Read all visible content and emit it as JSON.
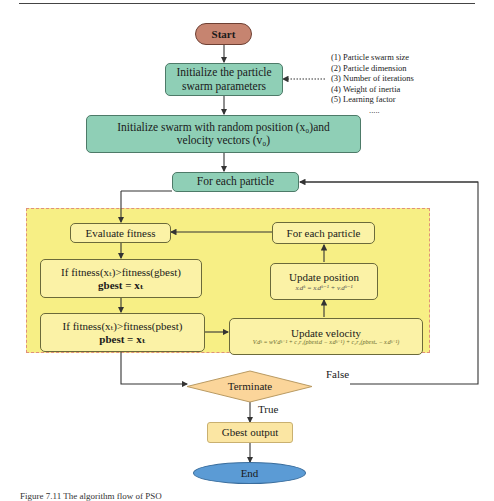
{
  "diagram": {
    "type": "flowchart",
    "nodes": {
      "start": "Start",
      "init_params_line1": "Initialize the particle",
      "init_params_line2": "swarm parameters",
      "init_swarm_line1": "Initialize swarm with random position (x₀)and",
      "init_swarm_line2": "velocity vectors (v₀)",
      "for_each_outer": "For each particle",
      "evaluate_fitness": "Evaluate fitness",
      "gbest_cond": "If fitness(xₜ)>fitness(gbest)",
      "gbest_assign": "gbest = xₜ",
      "pbest_cond": "If fitness(xₜ)>fitness(pbest)",
      "pbest_assign": "pbest = xₜ",
      "for_each_inner": "For each particle",
      "update_position": "Update position",
      "update_position_formula": "xᵢdᵏ = xᵢdᵏ⁻¹ + vᵢdᵏ⁻¹",
      "update_velocity": "Update velocity",
      "update_velocity_formula": "Vᵢdᵏ = wVᵢdᵏ⁻¹ + c₁r₁(pbestᵢd − xᵢdᵏ⁻¹) + c₂r₂(pbestₐ − xᵢdᵏ⁻¹)",
      "terminate": "Terminate",
      "gbest_output": "Gbest output",
      "end": "End"
    },
    "edge_labels": {
      "false": "False",
      "true": "True"
    },
    "parameters": [
      "(1) Particle swarm size",
      "(2) Particle dimension",
      "(3) Number of iterations",
      "(4) Weight of inertia",
      "(5) Learning factor"
    ],
    "parameters_more": ".....",
    "caption": "Figure 7.11  The algorithm flow of PSO"
  },
  "colors": {
    "start_fill": "#c68470",
    "green_fill": "#8fcfb6",
    "loop_region": "#f7ef85",
    "yellow_box": "#fbf2a6",
    "terminate_fill": "#fbd59a",
    "gbest_output_fill": "#fbe6a3",
    "end_fill": "#5b9bd5"
  }
}
